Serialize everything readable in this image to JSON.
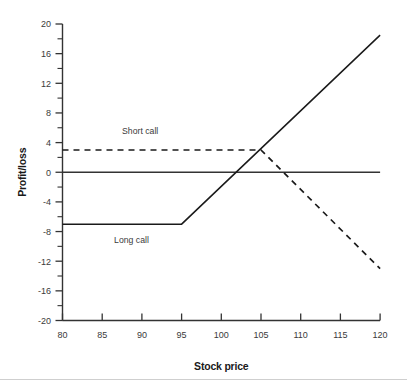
{
  "chart_data": {
    "type": "line",
    "title": "",
    "xlabel": "Stock price",
    "ylabel": "Profit/loss",
    "xlim": [
      80,
      120
    ],
    "ylim": [
      -20,
      20
    ],
    "grid": false,
    "legend_position": "inline-annotations",
    "x_ticks": [
      80,
      85,
      90,
      95,
      100,
      105,
      110,
      115,
      120
    ],
    "x_tick_labels": [
      "80",
      "85",
      "90",
      "95",
      "100",
      "105",
      "110",
      "115",
      "120"
    ],
    "y_ticks": [
      -20,
      -16,
      -12,
      -8,
      -4,
      0,
      4,
      8,
      12,
      16,
      20
    ],
    "y_tick_labels": [
      "-20",
      "-16",
      "-12",
      "-8",
      "-4",
      "0",
      "4",
      "8",
      "12",
      "16",
      "20"
    ],
    "y_minor_ticks": [
      -18,
      -14,
      -10,
      -6,
      -2,
      2,
      6,
      10,
      14,
      18
    ],
    "series": [
      {
        "name": "Long call",
        "style": "solid",
        "color": "#1a1a1a",
        "label_text": "Long call",
        "label_x": 86.5,
        "label_y": -9.6,
        "points": [
          {
            "x": 80,
            "y": -7
          },
          {
            "x": 95,
            "y": -7
          },
          {
            "x": 120,
            "y": 18.5
          }
        ]
      },
      {
        "name": "Short call",
        "style": "dashed",
        "color": "#1a1a1a",
        "label_text": "Short call",
        "label_x": 87.5,
        "label_y": 5.2,
        "points": [
          {
            "x": 80,
            "y": 3
          },
          {
            "x": 105,
            "y": 3
          },
          {
            "x": 120,
            "y": -13
          }
        ]
      },
      {
        "name": "Zero line",
        "style": "solid",
        "color": "#333333",
        "points": [
          {
            "x": 80,
            "y": 0
          },
          {
            "x": 120,
            "y": 0
          }
        ]
      }
    ],
    "annotations": [
      {
        "text": "Short call",
        "x": 87.5,
        "y": 5.2
      },
      {
        "text": "Long call",
        "x": 86.5,
        "y": -9.6
      }
    ]
  },
  "labels": {
    "x_axis_title": "Stock price",
    "y_axis_title": "Profit/loss",
    "short_call": "Short call",
    "long_call": "Long call"
  },
  "ticks": {
    "x": [
      "80",
      "85",
      "90",
      "95",
      "100",
      "105",
      "110",
      "115",
      "120"
    ],
    "y": [
      "20",
      "16",
      "12",
      "8",
      "4",
      "0",
      "-4",
      "-8",
      "-12",
      "-16",
      "-20"
    ]
  },
  "colors": {
    "line": "#1a1a1a",
    "axis": "#333333",
    "text": "#3a3a3a",
    "title_text": "#1a1a1a",
    "background": "#ffffff",
    "footer_rule": "#cfcfcf"
  }
}
